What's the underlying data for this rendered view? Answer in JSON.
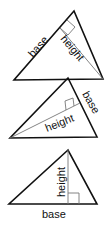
{
  "diagrams": [
    {
      "name": "triangle-1",
      "base_label": "base",
      "height_label": "height",
      "description": "Obtuse-oriented triangle with base along upper-left side, height drawn from bottom-right vertex perpendicular to it"
    },
    {
      "name": "triangle-2",
      "base_label": "base",
      "height_label": "height",
      "description": "Triangle with base along right side, height drawn from left vertex perpendicular to it"
    },
    {
      "name": "triangle-3",
      "base_label": "base",
      "height_label": "height",
      "description": "Triangle with base along bottom side, vertical height from apex"
    }
  ],
  "colors": {
    "outline": "#111111",
    "height_line": "#777777",
    "background": "#ffffff"
  }
}
